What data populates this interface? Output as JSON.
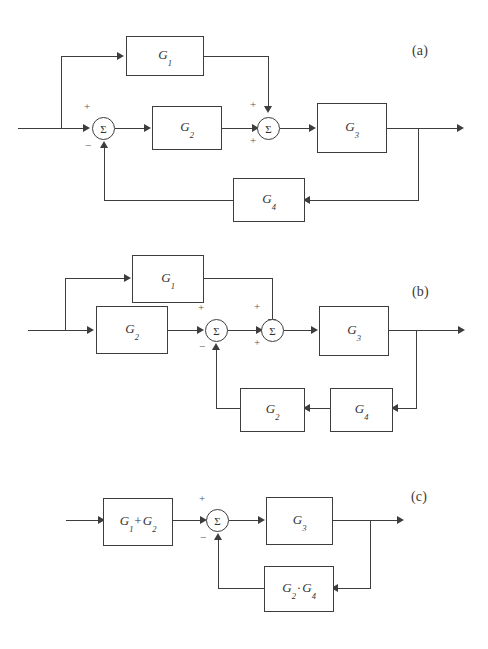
{
  "figure": {
    "type": "block-diagram",
    "background_color": "#ffffff",
    "line_color": "#3d3d3d",
    "text_color": "#333333",
    "sum_symbol": "Σ",
    "plus": "+",
    "minus": "−"
  },
  "panels": [
    {
      "id": "a",
      "label": "(a)",
      "blocks": [
        {
          "name": "G1",
          "base": "G",
          "sub": "1"
        },
        {
          "name": "G2",
          "base": "G",
          "sub": "2"
        },
        {
          "name": "G3",
          "base": "G",
          "sub": "3"
        },
        {
          "name": "G4",
          "base": "G",
          "sub": "4"
        }
      ],
      "summers": [
        {
          "name": "sum-1",
          "symbol": "Σ",
          "signs": [
            "+",
            "−"
          ]
        },
        {
          "name": "sum-2",
          "symbol": "Σ",
          "signs": [
            "+",
            "+"
          ]
        }
      ]
    },
    {
      "id": "b",
      "label": "(b)",
      "blocks": [
        {
          "name": "G1",
          "base": "G",
          "sub": "1"
        },
        {
          "name": "G2",
          "base": "G",
          "sub": "2"
        },
        {
          "name": "G3",
          "base": "G",
          "sub": "3"
        },
        {
          "name": "G2fb",
          "base": "G",
          "sub": "2"
        },
        {
          "name": "G4",
          "base": "G",
          "sub": "4"
        }
      ],
      "summers": [
        {
          "name": "sum-1",
          "symbol": "Σ",
          "signs": [
            "+",
            "−"
          ]
        },
        {
          "name": "sum-2",
          "symbol": "Σ",
          "signs": [
            "+",
            "+"
          ]
        }
      ]
    },
    {
      "id": "c",
      "label": "(c)",
      "blocks": [
        {
          "name": "G1plusG2",
          "base": "G",
          "sub": "1",
          "op": "+",
          "base2": "G",
          "sub2": "2"
        },
        {
          "name": "G3",
          "base": "G",
          "sub": "3"
        },
        {
          "name": "G2dotG4",
          "base": "G",
          "sub": "2",
          "op": "·",
          "base2": "G",
          "sub2": "4"
        }
      ],
      "summers": [
        {
          "name": "sum-1",
          "symbol": "Σ",
          "signs": [
            "+",
            "−"
          ]
        }
      ]
    }
  ]
}
